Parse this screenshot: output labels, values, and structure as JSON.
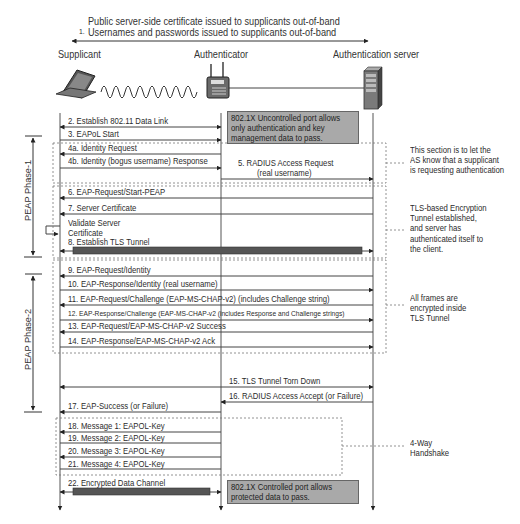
{
  "header": {
    "step1_number": "1.",
    "step1_line1": "Public server-side certificate issued to supplicants out-of-band",
    "step1_line2": "Usernames and passwords issued to supplicants out-of-band"
  },
  "actors": {
    "supplicant": "Supplicant",
    "authenticator": "Authenticator",
    "server": "Authentication server"
  },
  "icons": {
    "supplicant": "laptop-icon",
    "authenticator": "access-point-icon",
    "server": "server-tower-icon"
  },
  "phases": {
    "phase1": "PEAP Phase-1",
    "phase2": "PEAP Phase-2"
  },
  "messages": {
    "m2": "2. Establish 802.11 Data Link",
    "m3": "3. EAPoL Start",
    "m4a": "4a. Identity Request",
    "m4b": "4b. Identity (bogus username) Response",
    "m5a": "5. RADIUS Access Request",
    "m5b": "(real username)",
    "m6": "6. EAP-Request/Start-PEAP",
    "m7": "7. Server Certificate",
    "validate1": "Validate Server",
    "validate2": "Certificate",
    "m8": "8. Establish TLS Tunnel",
    "m9": "9. EAP-Request/Identity",
    "m10": "10. EAP-Response/Identity (real username)",
    "m11": "11. EAP-Request/Challenge (EAP-MS-CHAP-v2) (includes Challenge string)",
    "m12": "12. EAP-Response/Challenge (EAP-MS-CHAP-v2 (includes Response and Challenge strings)",
    "m13": "13. EAP-Request/EAP-MS-CHAP-v2 Success",
    "m14": "14. EAP-Response/EAP-MS-CHAP-v2 Ack",
    "m15": "15. TLS Tunnel Torn Down",
    "m16": "16. RADIUS Access Accept (or Failure)",
    "m17": "17. EAP-Success (or Failure)",
    "m18": "18. Message 1: EAPOL-Key",
    "m19": "19. Message 2: EAPOL-Key",
    "m20": "20. Message 3: EAPOL-Key",
    "m21": "21. Message 4: EAPOL-Key",
    "m22": "22. Encrypted Data Channel"
  },
  "boxes": {
    "uncontrolled": "802.1X Uncontrolled port allows\nonly authentication and key\nmanagement data to pass.",
    "controlled": "802.1X Controlled port allows\nprotected data to pass."
  },
  "notes": {
    "identity": "This section is to let the\nAS know that a supplicant\nis requesting authentication",
    "tls": "TLS-based Encryption\nTunnel established,\nand server has\nauthenticated itself to\nthe client.",
    "encrypted": "All frames are\nencrypted inside\nTLS Tunnel",
    "handshake": "4-Way\nHandshake"
  },
  "colors": {
    "line": "#555555",
    "box_fill": "#a9a9a9",
    "tunnel_bar": "#555555",
    "dashed": "#777777"
  }
}
